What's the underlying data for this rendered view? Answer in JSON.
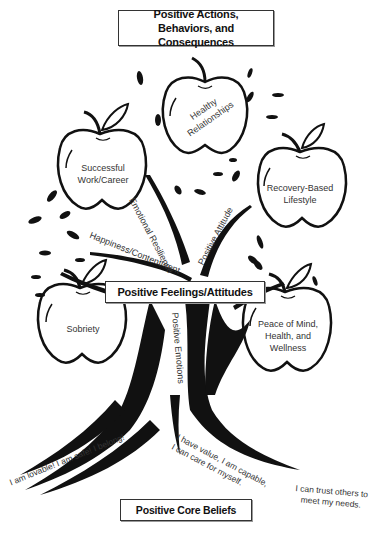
{
  "title_boxes": {
    "top": {
      "line1": "Positive Actions,",
      "line2": "Behaviors, and Consequences"
    },
    "middle": "Positive Feelings/Attitudes",
    "bottom": "Positive Core Beliefs"
  },
  "apples": [
    {
      "id": "healthy-relationships",
      "line1": "Healthy",
      "line2": "Relationships"
    },
    {
      "id": "successful-work",
      "line1": "Successful",
      "line2": "Work/Career"
    },
    {
      "id": "recovery-lifestyle",
      "line1": "Recovery-Based",
      "line2": "Lifestyle"
    },
    {
      "id": "sobriety",
      "line1": "Sobriety"
    },
    {
      "id": "peace-of-mind",
      "line1": "Peace of Mind,",
      "line2": "Health, and",
      "line3": "Wellness"
    }
  ],
  "branch_labels": {
    "emotional_resilience": "Emotional Resilience",
    "positive_attitude": "Positive Attitude",
    "happiness": "Happiness/Contentment",
    "positive_emotions": "Positive Emotions"
  },
  "root_labels": {
    "left": "I am lovable! I am safe! I belong!",
    "center_line1": "I have value, I am capable,",
    "center_line2": "I can care for myself.",
    "right_line1": "I can trust others to",
    "right_line2": "meet my needs."
  },
  "colors": {
    "ink": "#111111",
    "text": "#333333",
    "background": "#ffffff"
  }
}
